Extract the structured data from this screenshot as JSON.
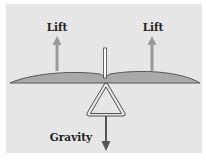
{
  "diagram": {
    "labels": {
      "lift_left": "Lift",
      "lift_right": "Lift",
      "gravity": "Gravity"
    },
    "colors": {
      "background": "#e6e6e6",
      "wing_fill": "#a9a9a9",
      "wing_stroke": "#555555",
      "lift_arrow": "#9a9a9a",
      "gravity_arrow": "#555555",
      "frame_stroke": "#444444",
      "text": "#222222"
    }
  }
}
